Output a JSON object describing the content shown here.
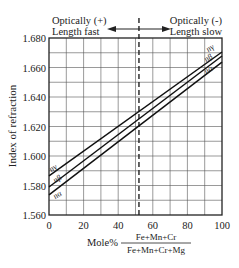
{
  "chart_data": {
    "type": "line",
    "title": "",
    "xlabel": "Mole%",
    "xlabel_fraction": {
      "numerator": "Fe+Mn+Cr",
      "denominator": "Fe+Mn+Cr+Mg"
    },
    "ylabel": "Index of refraction",
    "xlim": [
      0,
      100
    ],
    "ylim": [
      1.56,
      1.68
    ],
    "x_ticks": [
      "0",
      "20",
      "40",
      "60",
      "80",
      "100"
    ],
    "y_ticks": [
      "1.560",
      "1.580",
      "1.600",
      "1.620",
      "1.640",
      "1.660",
      "1.680"
    ],
    "grid": true,
    "x_grid_step": 10,
    "y_grid_step": 0.01,
    "series": [
      {
        "name": "n_γ",
        "label": "nγ",
        "x": [
          0,
          100
        ],
        "values": [
          1.5865,
          1.6705
        ]
      },
      {
        "name": "n_β",
        "label": "nβ",
        "x": [
          0,
          100
        ],
        "values": [
          1.579,
          1.6678
        ]
      },
      {
        "name": "n_α",
        "label": "nα",
        "x": [
          0,
          100
        ],
        "values": [
          1.5736,
          1.6637
        ]
      }
    ],
    "vertical_marker": {
      "x": 52,
      "style": "dashed"
    },
    "annotations": {
      "left": {
        "line1": "Optically (+)",
        "line2": "Length fast"
      },
      "right": {
        "line1": "Optically (-)",
        "line2": "Length slow"
      },
      "arrow": "double-headed horizontal arrow centered on marker"
    }
  }
}
